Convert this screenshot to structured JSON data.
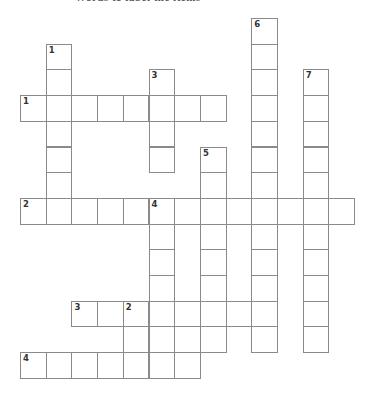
{
  "page": {
    "header_cut_text": "Words to label the items"
  },
  "crossword": {
    "origin": {
      "x": 20,
      "y": 18
    },
    "cell_size": 25.7,
    "border_color": "#8a8a8a",
    "words": [
      {
        "label": "1",
        "dir": "across",
        "row": 3,
        "col": 0,
        "length": 8
      },
      {
        "label": "2",
        "dir": "across",
        "row": 7,
        "col": 0,
        "length": 13
      },
      {
        "label": "3",
        "dir": "across",
        "row": 11,
        "col": 2,
        "length": 8
      },
      {
        "label": "4",
        "dir": "across",
        "row": 13,
        "col": 0,
        "length": 7
      },
      {
        "label": "1",
        "dir": "down",
        "row": 1,
        "col": 1,
        "length": 7
      },
      {
        "label": "2",
        "dir": "down",
        "row": 11,
        "col": 4,
        "length": 3
      },
      {
        "label": "3",
        "dir": "down",
        "row": 2,
        "col": 5,
        "length": 4
      },
      {
        "label": "4",
        "dir": "down",
        "row": 7,
        "col": 5,
        "length": 7
      },
      {
        "label": "5",
        "dir": "down",
        "row": 5,
        "col": 7,
        "length": 8
      },
      {
        "label": "6",
        "dir": "down",
        "row": 0,
        "col": 9,
        "length": 13
      },
      {
        "label": "7",
        "dir": "down",
        "row": 2,
        "col": 11,
        "length": 11
      }
    ]
  }
}
